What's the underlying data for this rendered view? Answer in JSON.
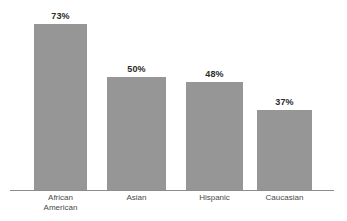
{
  "chart_data": {
    "type": "bar",
    "title": "",
    "subtitle": "",
    "xlabel": "",
    "ylabel": "",
    "ylim": [
      0,
      80
    ],
    "grid": false,
    "legend": false,
    "legend_position": "none",
    "axis_line": true,
    "value_label_suffix": "%",
    "bar_color": "#969696",
    "axis_color": "#8c8c8c",
    "value_text_color": "#2b2b2b",
    "category_text_color": "#4a4a4a",
    "categories": [
      "African American",
      "Asian",
      "Hispanic",
      "Caucasian"
    ],
    "values": [
      73,
      50,
      48,
      37
    ],
    "value_labels": [
      "73%",
      "50%",
      "48%",
      "37%"
    ],
    "bars": [
      {
        "category": "African American",
        "category_line1": "African",
        "category_line2": "American",
        "value": 73,
        "value_label": "73%"
      },
      {
        "category": "Asian",
        "category_line1": "Asian",
        "category_line2": "",
        "value": 50,
        "value_label": "50%"
      },
      {
        "category": "Hispanic",
        "category_line1": "Hispanic",
        "category_line2": "",
        "value": 48,
        "value_label": "48%"
      },
      {
        "category": "Caucasian",
        "category_line1": "Caucasian",
        "category_line2": "",
        "value": 37,
        "value_label": "37%"
      }
    ],
    "layout": {
      "baseline_y": 190,
      "axis_left": 10,
      "axis_right": 334,
      "bar_geometry": [
        {
          "left": 34,
          "width": 53,
          "top": 24
        },
        {
          "left": 107,
          "width": 59,
          "top": 77
        },
        {
          "left": 186,
          "width": 57,
          "top": 82
        },
        {
          "left": 257,
          "width": 55,
          "top": 110
        }
      ]
    }
  }
}
